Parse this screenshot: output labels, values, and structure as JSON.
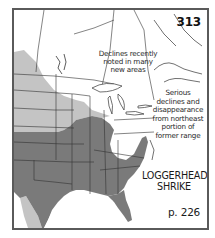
{
  "map": {
    "plate_number": "313",
    "species_name_line1": "LOGGERHEAD",
    "species_name_line2": "SHRIKE",
    "page_reference": "p. 226",
    "annotations": [
      {
        "lines": [
          "Declines recently",
          "noted in many",
          "new areas"
        ]
      },
      {
        "lines": [
          "Serious",
          "declines and",
          "disappearance",
          "from northeast",
          "portion of",
          "former range"
        ]
      }
    ],
    "legend_colors": {
      "year_round_range": "#7a7a7a",
      "breeding_or_declining_range": "#c4c4c4",
      "land": "#ffffff",
      "borders": "#333333",
      "frame": "#5a5a5a"
    },
    "region": "Eastern North America"
  }
}
